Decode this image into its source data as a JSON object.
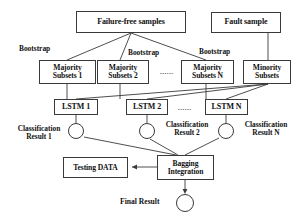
{
  "diagram": {
    "stroke_color": "#3a3a3a",
    "text_color": "#111111",
    "background": "#ffffff",
    "width": 302,
    "height": 219
  },
  "sources": {
    "failure_free": "Failure-free samples",
    "fault": "Fault sample"
  },
  "bootstrap_labels": [
    "Bootstrap",
    "Bootstrap",
    "Bootstrap"
  ],
  "subsets": {
    "majority_1": {
      "line1": "Majority",
      "line2": "Subsets 1"
    },
    "majority_2": {
      "line1": "Majority",
      "line2": "Subsets 2"
    },
    "majority_n": {
      "line1": "Majority",
      "line2": "Subsets N"
    },
    "minority": {
      "line1": "Minority",
      "line2": "Subsets"
    }
  },
  "models": {
    "lstm_1": "LSTM 1",
    "lstm_2": "LSTM 2",
    "lstm_n": "LSTM N"
  },
  "results": {
    "result_1": {
      "line1": "Classification",
      "line2": "Result 1"
    },
    "result_2": {
      "line1": "Classification",
      "line2": "Result 2"
    },
    "result_n": {
      "line1": "Classification",
      "line2": "Result N"
    }
  },
  "integration": {
    "bagging": {
      "line1": "Bagging",
      "line2": "Integration"
    },
    "testing_data": "Testing DATA",
    "final_result": "Final Result"
  },
  "ellipsis": {
    "subsets_row": "......",
    "lstm_row": "......"
  }
}
